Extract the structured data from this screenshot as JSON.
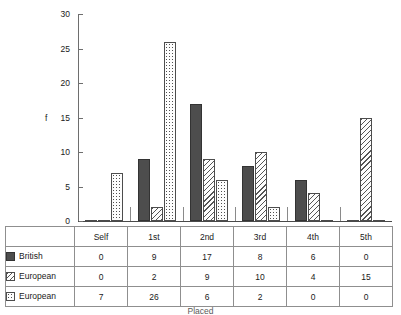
{
  "chart_data": {
    "type": "bar",
    "title": "",
    "subtitle": "",
    "xlabel": "Placed",
    "ylabel": "f",
    "ylim": [
      0,
      30
    ],
    "yticks": [
      0,
      5,
      10,
      15,
      20,
      25,
      30
    ],
    "grid": false,
    "legend_position": "table-left",
    "categories": [
      "Self",
      "1st",
      "2nd",
      "3rd",
      "4th",
      "5th"
    ],
    "series": [
      {
        "name": "British",
        "pattern": "solid",
        "color": "#4d4d4d",
        "values": [
          0,
          9,
          17,
          8,
          6,
          0
        ]
      },
      {
        "name": "European",
        "pattern": "hatch",
        "color": "#ffffff",
        "values": [
          0,
          2,
          9,
          10,
          4,
          15
        ]
      },
      {
        "name": "European",
        "pattern": "dots",
        "color": "#ffffff",
        "values": [
          7,
          26,
          6,
          2,
          0,
          0
        ]
      }
    ]
  },
  "axis": {
    "y_label": "f",
    "ticks": [
      "0",
      "5",
      "10",
      "15",
      "20",
      "25",
      "30"
    ]
  },
  "table": {
    "corner": "",
    "headers": [
      "Self",
      "1st",
      "2nd",
      "3rd",
      "4th",
      "5th"
    ],
    "rows": [
      {
        "legend": "British",
        "swatch": "solid-swatch-icon",
        "values": [
          "0",
          "9",
          "17",
          "8",
          "6",
          "0"
        ]
      },
      {
        "legend": "European",
        "swatch": "hatch-swatch-icon",
        "values": [
          "0",
          "2",
          "9",
          "10",
          "4",
          "15"
        ]
      },
      {
        "legend": "European",
        "swatch": "dots-swatch-icon",
        "values": [
          "7",
          "26",
          "6",
          "2",
          "0",
          "0"
        ]
      }
    ]
  },
  "footer": {
    "x_axis_title": "Placed"
  },
  "colors": {
    "series_solid": "#4d4d4d",
    "series_outline": "#4d4d4d",
    "axis": "#6e6e6e",
    "grid_border": "#8f8f8f",
    "text": "#1a1a1a"
  }
}
